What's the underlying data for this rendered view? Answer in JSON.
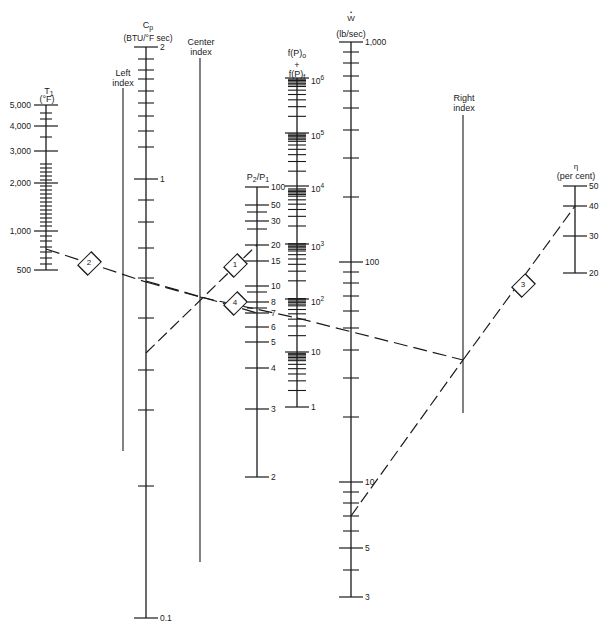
{
  "chart_data": {
    "type": "nomogram",
    "title": "",
    "scales": [
      {
        "id": "T1",
        "title": "T1",
        "unit": "(°F)",
        "x": 46,
        "top": 105,
        "bottom": 270,
        "labels": [
          {
            "value": "5,000",
            "y": 105
          },
          {
            "value": "4,000",
            "y": 126
          },
          {
            "value": "3,000",
            "y": 151
          },
          {
            "value": "2,000",
            "y": 183
          },
          {
            "value": "1,000",
            "y": 231
          },
          {
            "value": "500",
            "y": 270
          }
        ],
        "minor_ticks": [
          113,
          119,
          137,
          164,
          168,
          172,
          176,
          180,
          186,
          190,
          194,
          198,
          202,
          206,
          210,
          214,
          218,
          222,
          226,
          236,
          241,
          247,
          252,
          258,
          264
        ],
        "label_side": "left"
      },
      {
        "id": "left_index",
        "title": "Left index",
        "x": 123,
        "top": 88,
        "bottom": 451,
        "type": "index"
      },
      {
        "id": "Cp",
        "title": "Cp",
        "unit": "(BTU/°F sec)",
        "x": 146,
        "top": 47,
        "bottom": 618,
        "labels": [
          {
            "value": "2",
            "y": 47
          },
          {
            "value": "1",
            "y": 179
          },
          {
            "value": "0.1",
            "y": 618
          }
        ],
        "minor_ticks": [
          59,
          70,
          79,
          91,
          103,
          116,
          131,
          147,
          200,
          222,
          248,
          278,
          318,
          370,
          410,
          486
        ],
        "label_side": "right"
      },
      {
        "id": "center_index",
        "title": "Center index",
        "x": 200,
        "top": 58,
        "bottom": 562,
        "type": "index"
      },
      {
        "id": "P2P1",
        "title": "P2/P1",
        "x": 257,
        "top": 187,
        "bottom": 477,
        "labels": [
          {
            "value": "100",
            "y": 187
          },
          {
            "value": "50",
            "y": 205
          },
          {
            "value": "30",
            "y": 221
          },
          {
            "value": "20",
            "y": 245
          },
          {
            "value": "15",
            "y": 261
          },
          {
            "value": "10",
            "y": 286
          },
          {
            "value": "8",
            "y": 302
          },
          {
            "value": "7",
            "y": 313
          },
          {
            "value": "6",
            "y": 327
          },
          {
            "value": "5",
            "y": 342
          },
          {
            "value": "4",
            "y": 368
          },
          {
            "value": "3",
            "y": 409
          },
          {
            "value": "2",
            "y": 477
          }
        ],
        "minor_ticks": [
          212,
          229,
          292,
          308
        ],
        "label_side": "right"
      },
      {
        "id": "fP",
        "title": "f(P)o + f(P)f",
        "x": 297,
        "top": 78,
        "bottom": 407,
        "labels": [
          {
            "value": "10^6",
            "y": 78
          },
          {
            "value": "10^5",
            "y": 133
          },
          {
            "value": "10^4",
            "y": 186
          },
          {
            "value": "10^3",
            "y": 244
          },
          {
            "value": "10^2",
            "y": 299
          },
          {
            "value": "10",
            "y": 352
          },
          {
            "value": "1",
            "y": 407
          }
        ],
        "decade_count": 6,
        "label_side": "right"
      },
      {
        "id": "W",
        "title": "Ẇ",
        "unit": "(lb/sec)",
        "x": 351,
        "top": 42,
        "bottom": 597,
        "labels": [
          {
            "value": "1,000",
            "y": 42
          },
          {
            "value": "100",
            "y": 262
          },
          {
            "value": "10",
            "y": 482
          },
          {
            "value": "5",
            "y": 548
          },
          {
            "value": "3",
            "y": 597
          }
        ],
        "minor_ticks": [
          52,
          63,
          76,
          91,
          108,
          130,
          158,
          197,
          272,
          283,
          296,
          311,
          328,
          350,
          378,
          417,
          492,
          503,
          516,
          531,
          570
        ],
        "label_side": "right"
      },
      {
        "id": "right_index",
        "title": "Right index",
        "x": 463,
        "top": 115,
        "bottom": 413,
        "type": "index"
      },
      {
        "id": "eta",
        "title": "η",
        "unit": "(per cent)",
        "x": 575,
        "top": 186,
        "bottom": 273,
        "labels": [
          {
            "value": "50",
            "y": 186
          },
          {
            "value": "40",
            "y": 206
          },
          {
            "value": "30",
            "y": 236
          },
          {
            "value": "20",
            "y": 273
          }
        ],
        "minor_ticks": [],
        "label_side": "right"
      }
    ],
    "construction_lines": [
      {
        "step": "1",
        "from": {
          "scale": "Cp",
          "x": 146,
          "y": 353
        },
        "to": {
          "scale": "P2P1",
          "value": "20",
          "x": 257,
          "y": 245
        },
        "label_at": {
          "x": 235,
          "y": 265
        }
      },
      {
        "step": "2",
        "from": {
          "scale": "T1",
          "value": "~750",
          "x": 46,
          "y": 249
        },
        "to": {
          "scale": "center_index",
          "x": 200,
          "y": 297
        },
        "label_at": {
          "x": 89,
          "y": 263
        },
        "via": {
          "scale": "Cp",
          "x": 146,
          "y": 282
        }
      },
      {
        "step": "4",
        "from": {
          "scale": "Cp",
          "x": 146,
          "y": 281
        },
        "to": {
          "scale": "P2P1",
          "value": "7",
          "x": 257,
          "y": 313
        },
        "label_at": {
          "x": 235,
          "y": 303
        }
      },
      {
        "step": "center_to_right",
        "from": {
          "scale": "center_index",
          "x": 200,
          "y": 297
        },
        "to": {
          "scale": "right_index",
          "x": 463,
          "y": 360
        },
        "via": {
          "scale": "fP",
          "x": 297,
          "y": 318
        }
      },
      {
        "step": "3",
        "from": {
          "scale": "W",
          "value": "~7",
          "x": 351,
          "y": 516
        },
        "to": {
          "scale": "eta",
          "value": "40",
          "x": 575,
          "y": 206
        },
        "label_at": {
          "x": 523,
          "y": 285
        },
        "via": {
          "scale": "right_index",
          "x": 463,
          "y": 360
        }
      }
    ],
    "markers": [
      {
        "label": "1",
        "x": 235,
        "y": 265
      },
      {
        "label": "2",
        "x": 89,
        "y": 263
      },
      {
        "label": "3",
        "x": 523,
        "y": 285
      },
      {
        "label": "4",
        "x": 235,
        "y": 303
      }
    ]
  },
  "labels": {
    "t1_title": "T",
    "t1_sub": "1",
    "t1_unit": "(°F)",
    "left_index_1": "Left",
    "left_index_2": "index",
    "cp_title": "C",
    "cp_sub": "p",
    "cp_unit": "(BTU/°F sec)",
    "center_index_1": "Center",
    "center_index_2": "index",
    "p_title": "P",
    "p_sub1": "2",
    "p_slash": "/P",
    "p_sub2": "1",
    "fp_o": "f(P)",
    "fp_o_sub": "o",
    "fp_plus": "+",
    "fp_f": "f(P)",
    "fp_f_sub": "f",
    "w_dot": "•",
    "w_title": "W",
    "w_unit": "(lb/sec)",
    "right_index_1": "Right",
    "right_index_2": "index",
    "eta_title": "η",
    "eta_unit": "(per cent)"
  }
}
